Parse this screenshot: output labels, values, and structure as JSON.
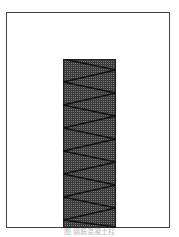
{
  "figure": {
    "caption": "图 钢筋混凝土柱",
    "frame_color": "#444444",
    "column": {
      "fill_pattern": "cross-hatch grid",
      "fill_color": "#7a7a7a",
      "zigzag_segments": 15
    }
  }
}
